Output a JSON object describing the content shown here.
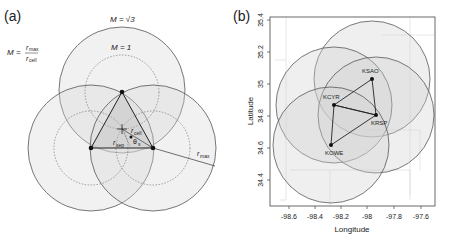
{
  "panel_a": {
    "label": "(a)",
    "m_sqrt3_label": "M = √3",
    "m_one_label": "M = 1",
    "m_formula": {
      "lhs": "M =",
      "num": "r",
      "num_sub": "max",
      "den": "r",
      "den_sub": "cell"
    },
    "r_cell_label": {
      "r": "r",
      "sub": "cell"
    },
    "r_sep_label": {
      "r": "r",
      "sub": "sep"
    },
    "theta_label": {
      "t": "θ",
      "sub": "s"
    },
    "r_max_label": {
      "r": "r",
      "sub": "max"
    }
  },
  "panel_b": {
    "label": "(b)",
    "xlabel": "Longitude",
    "ylabel": "Latitude",
    "xticks": [
      "-98.6",
      "-98.4",
      "-98.2",
      "-98",
      "-97.8",
      "-97.6"
    ],
    "yticks": [
      "35.4",
      "35.2",
      "35",
      "34.8",
      "34.6",
      "34.4"
    ],
    "stations": [
      {
        "name": "KSAO",
        "lon": -97.97,
        "lat": 35.05
      },
      {
        "name": "KCYR",
        "lon": -98.26,
        "lat": 34.87
      },
      {
        "name": "KRSP",
        "lon": -97.93,
        "lat": 34.81
      },
      {
        "name": "KOWE",
        "lon": -98.28,
        "lat": 34.62
      }
    ]
  }
}
